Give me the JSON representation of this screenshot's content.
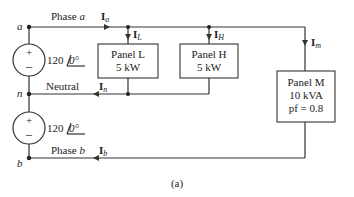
{
  "nodes": {
    "a": "a",
    "n": "n",
    "b": "b"
  },
  "wires": {
    "phase_a": "Phase a",
    "neutral": "Neutral",
    "phase_b": "Phase b"
  },
  "currents": {
    "Ia": {
      "main": "I",
      "sub": "a"
    },
    "IL": {
      "main": "I",
      "sub": "L"
    },
    "IH": {
      "main": "I",
      "sub": "H"
    },
    "Im": {
      "main": "I",
      "sub": "m"
    },
    "In": {
      "main": "I",
      "sub": "n"
    },
    "Ib": {
      "main": "I",
      "sub": "b"
    }
  },
  "sources": [
    {
      "name": "upper",
      "magnitude": "120",
      "angle": "0°"
    },
    {
      "name": "lower",
      "magnitude": "120",
      "angle": "0°"
    }
  ],
  "panels": {
    "L": {
      "title": "Panel L",
      "rating": "5 kW"
    },
    "H": {
      "title": "Panel H",
      "rating": "5 kW"
    },
    "M": {
      "title": "Panel M",
      "rating": "10 kVA",
      "pf": "pf = 0.8"
    }
  },
  "caption": "(a)",
  "colors": {
    "wire": "#333333",
    "text": "#222222",
    "background": "#ffffff"
  }
}
